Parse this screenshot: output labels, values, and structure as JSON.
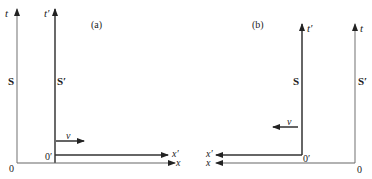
{
  "figure": {
    "panel_a": {
      "caption": "(a)",
      "frame_S": {
        "label": "S",
        "time_axis": "t",
        "space_axis": "x",
        "origin": "0"
      },
      "frame_S_prime": {
        "label": "S′",
        "time_axis": "t′",
        "space_axis": "x′",
        "origin": "0′"
      },
      "velocity": {
        "label": "v",
        "direction": "right"
      }
    },
    "panel_b": {
      "caption": "(b)",
      "frame_S": {
        "label": "S",
        "time_axis": "t′",
        "origin": "0′",
        "space_axis": "x′"
      },
      "frame_S_prime": {
        "label": "S′",
        "time_axis": "t",
        "origin": "0",
        "space_axis": "x"
      },
      "velocity": {
        "label": "v",
        "direction": "left"
      }
    },
    "colors": {
      "line": "#333333",
      "light_line": "#777777",
      "text": "#222222"
    }
  }
}
